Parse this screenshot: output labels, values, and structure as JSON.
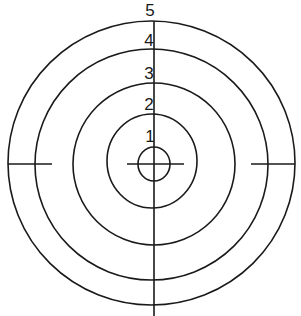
{
  "diagram": {
    "type": "concentric-target",
    "colors": {
      "stroke": "#1a1a1a",
      "background": "#ffffff"
    },
    "center": {
      "x": 152,
      "y": 163
    },
    "rings": [
      {
        "id": "inner",
        "label": "",
        "cx": 154,
        "cy": 164,
        "rx": 16,
        "ry": 17
      },
      {
        "id": "ring-1",
        "label": "1",
        "cx": 152,
        "cy": 161,
        "rx": 45,
        "ry": 47
      },
      {
        "id": "ring-2",
        "label": "2",
        "cx": 154,
        "cy": 164,
        "rx": 81,
        "ry": 81
      },
      {
        "id": "ring-3",
        "label": "3",
        "cx": 151.5,
        "cy": 164.5,
        "rx": 116.5,
        "ry": 115.5
      },
      {
        "id": "ring-4",
        "label": "4",
        "cx": 151.5,
        "cy": 163,
        "rx": 143.5,
        "ry": 142
      }
    ],
    "labels": [
      {
        "text": "5",
        "x": 150,
        "y": 16
      },
      {
        "text": "4",
        "x": 149,
        "y": 46
      },
      {
        "text": "3",
        "x": 149,
        "y": 79
      },
      {
        "text": "2",
        "x": 149,
        "y": 110
      },
      {
        "text": "1",
        "x": 150,
        "y": 142
      }
    ],
    "lines": {
      "vertical": {
        "x1": 154,
        "y1": 21,
        "x2": 154,
        "y2": 316
      },
      "crosshair": {
        "x1": 127,
        "y1": 164,
        "x2": 184,
        "y2": 164
      },
      "tick_left": {
        "x1": 8,
        "y1": 164,
        "x2": 52,
        "y2": 164
      },
      "tick_right": {
        "x1": 251,
        "y1": 164,
        "x2": 295,
        "y2": 164
      }
    }
  }
}
